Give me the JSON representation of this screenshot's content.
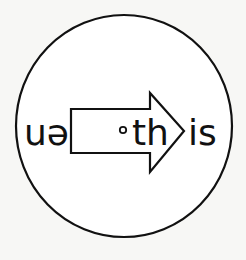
{
  "diagram": {
    "left_text": "uə",
    "dot_marker": "•",
    "arrow_text": "th",
    "right_text": "is",
    "colors": {
      "ink": "#111111",
      "background": "#f7f7f5",
      "fill": "#ffffff"
    }
  }
}
